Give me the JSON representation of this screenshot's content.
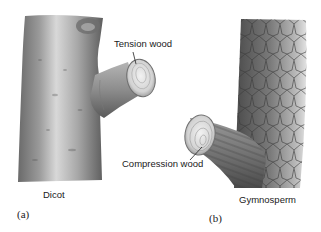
{
  "figure": {
    "panels": [
      {
        "letter": "(a)",
        "caption": "Dicot",
        "callout": "Tension wood"
      },
      {
        "letter": "(b)",
        "caption": "Gymnosperm",
        "callout": "Compression wood"
      }
    ]
  }
}
